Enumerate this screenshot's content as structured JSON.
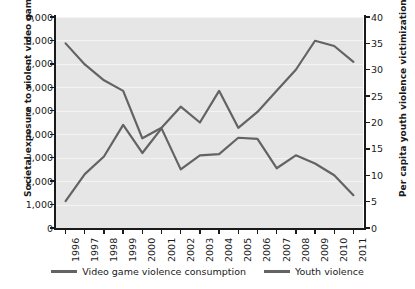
{
  "chart_data": {
    "type": "line",
    "title": "",
    "xlabel": "",
    "ylabel": "Societal exposure to violent video games",
    "ylabel_secondary": "Per capita youth violence victimization",
    "grid": true,
    "legend_position": "bottom",
    "x": [
      1996,
      1997,
      1998,
      1999,
      2000,
      2001,
      2002,
      2003,
      2004,
      2005,
      2006,
      2007,
      2008,
      2009,
      2010,
      2011
    ],
    "categories": [
      "1996",
      "1997",
      "1998",
      "1999",
      "2000",
      "2001",
      "2002",
      "2003",
      "2004",
      "2005",
      "2006",
      "2007",
      "2008",
      "2009",
      "2010",
      "2011"
    ],
    "yticks_left": [
      "0",
      "1,000",
      "2,000",
      "3,000",
      "4,000",
      "5,000",
      "6,000",
      "7,000",
      "8,000",
      "9,000"
    ],
    "ytick_values_left": [
      0,
      1000,
      2000,
      3000,
      4000,
      5000,
      6000,
      7000,
      8000,
      9000
    ],
    "ylim": [
      0,
      9000
    ],
    "yticks_right": [
      "0",
      "5",
      "10",
      "15",
      "20",
      "25",
      "30",
      "35",
      "40"
    ],
    "ytick_values_right": [
      0,
      5,
      10,
      15,
      20,
      25,
      30,
      35,
      40
    ],
    "ylim_secondary": [
      0,
      40
    ],
    "series": [
      {
        "name": "Video game violence consumption",
        "axis": "left",
        "color": "#636363",
        "values": [
          1150,
          2300,
          3050,
          4400,
          3200,
          4250,
          2500,
          3100,
          3150,
          3850,
          3800,
          2550,
          3100,
          2750,
          2250,
          1400
        ]
      },
      {
        "name": "Youth violence",
        "axis": "right",
        "color": "#636363",
        "values": [
          35,
          31,
          28,
          26,
          17,
          19,
          23,
          20,
          26,
          19,
          22,
          26,
          30,
          35.5,
          34.5,
          31.5
        ]
      }
    ]
  },
  "legend": {
    "entries": [
      {
        "label": "Video game violence consumption"
      },
      {
        "label": "Youth violence"
      }
    ]
  },
  "colors": {
    "line": "#636363",
    "plot_background": "#e6e6e6",
    "gridline": "#f4f4f4",
    "axis": "#1a1a1a",
    "text": "#1a1a1a"
  }
}
